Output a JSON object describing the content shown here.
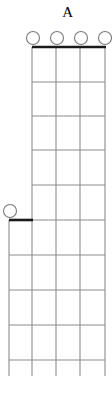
{
  "diagram": {
    "kind": "guitar-chord-diagram",
    "title": "A",
    "colors": {
      "grid": "#8c8c8c",
      "nut": "#1a1a1a",
      "barre": "#1a1a1a",
      "marker_stroke": "#7a7a7a",
      "marker_fill": "#ffffff",
      "background": "#ffffff",
      "text": "#000000"
    },
    "open_string_markers": {
      "name": "open-string-circles",
      "count": 5,
      "radius": 6.5,
      "items": [
        {
          "label": "open",
          "cx": 33,
          "cy": 38,
          "group": "top"
        },
        {
          "label": "open",
          "cx": 57,
          "cy": 38,
          "group": "top"
        },
        {
          "label": "open",
          "cx": 81,
          "cy": 38,
          "group": "top"
        },
        {
          "label": "open",
          "cx": 105,
          "cy": 38,
          "group": "top"
        },
        {
          "label": "open",
          "cx": 10,
          "cy": 211,
          "group": "left"
        }
      ]
    },
    "upper_grid": {
      "name": "upper-fretboard",
      "left": 32,
      "right": 105,
      "top": 47,
      "bottom": 220,
      "string_x": [
        32,
        56,
        80,
        105
      ],
      "fret_y": [
        47,
        82,
        116,
        150,
        185,
        220
      ]
    },
    "lower_grid": {
      "name": "lower-fretboard",
      "left": 9,
      "right": 105,
      "top": 220,
      "bottom": 376,
      "string_x": [
        9,
        32,
        56,
        80,
        105
      ],
      "fret_y": [
        220,
        255,
        290,
        325,
        360
      ]
    },
    "nut": {
      "name": "nut-bar",
      "x1": 32,
      "x2": 106,
      "y": 47
    },
    "barre": {
      "name": "barre-bar",
      "x1": 9,
      "x2": 33,
      "y": 220
    }
  }
}
